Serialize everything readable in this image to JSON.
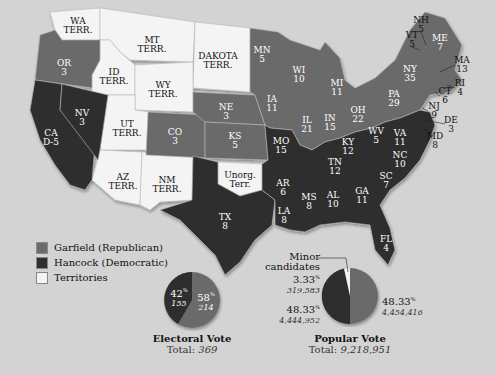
{
  "colors": {
    "garfield": "#6b6b6b",
    "hancock": "#2f2f2f",
    "territory": "#f4f4f4",
    "background": "#d3d3d3"
  },
  "legend": [
    {
      "label": "Garfield (Republican)",
      "color": "#6b6b6b"
    },
    {
      "label": "Hancock (Democratic)",
      "color": "#2f2f2f"
    },
    {
      "label": "Territories",
      "color": "#f4f4f4"
    }
  ],
  "states": [
    {
      "abbr": "WA",
      "sub": "TERR.",
      "x": 78,
      "y": 26,
      "party": "territory"
    },
    {
      "abbr": "MT",
      "sub": "TERR.",
      "x": 152,
      "y": 45,
      "party": "territory"
    },
    {
      "abbr": "DAKOTA",
      "sub": "TERR.",
      "x": 218,
      "y": 61,
      "party": "territory"
    },
    {
      "abbr": "OR",
      "sub": "3",
      "x": 64,
      "y": 68,
      "party": "garfield"
    },
    {
      "abbr": "ID",
      "sub": "TERR.",
      "x": 114,
      "y": 77,
      "party": "territory"
    },
    {
      "abbr": "WY",
      "sub": "TERR.",
      "x": 163,
      "y": 90,
      "party": "territory"
    },
    {
      "abbr": "NV",
      "sub": "3",
      "x": 82,
      "y": 118,
      "party": "hancock"
    },
    {
      "abbr": "UT",
      "sub": "TERR.",
      "x": 127,
      "y": 129,
      "party": "territory"
    },
    {
      "abbr": "CO",
      "sub": "3",
      "x": 175,
      "y": 137,
      "party": "garfield"
    },
    {
      "abbr": "CA",
      "sub": "D-5",
      "x": 51,
      "y": 138,
      "party": "hancock"
    },
    {
      "abbr": "NE",
      "sub": "3",
      "x": 226,
      "y": 112,
      "party": "garfield"
    },
    {
      "abbr": "KS",
      "sub": "5",
      "x": 235,
      "y": 141,
      "party": "garfield"
    },
    {
      "abbr": "AZ",
      "sub": "TERR.",
      "x": 123,
      "y": 182,
      "party": "territory"
    },
    {
      "abbr": "NM",
      "sub": "TERR.",
      "x": 167,
      "y": 185,
      "party": "territory"
    },
    {
      "abbr": "Unorg.",
      "sub": "Terr.",
      "x": 240,
      "y": 180,
      "party": "territory"
    },
    {
      "abbr": "TX",
      "sub": "8",
      "x": 225,
      "y": 222,
      "party": "hancock"
    },
    {
      "abbr": "MN",
      "sub": "5",
      "x": 262,
      "y": 55,
      "party": "garfield"
    },
    {
      "abbr": "WI",
      "sub": "10",
      "x": 299,
      "y": 75,
      "party": "garfield"
    },
    {
      "abbr": "MI",
      "sub": "11",
      "x": 337,
      "y": 88,
      "party": "garfield"
    },
    {
      "abbr": "IA",
      "sub": "11",
      "x": 272,
      "y": 104,
      "party": "garfield"
    },
    {
      "abbr": "IL",
      "sub": "21",
      "x": 307,
      "y": 125,
      "party": "garfield"
    },
    {
      "abbr": "IN",
      "sub": "15",
      "x": 330,
      "y": 123,
      "party": "garfield"
    },
    {
      "abbr": "OH",
      "sub": "22",
      "x": 358,
      "y": 115,
      "party": "garfield"
    },
    {
      "abbr": "PA",
      "sub": "29",
      "x": 394,
      "y": 99,
      "party": "garfield"
    },
    {
      "abbr": "NY",
      "sub": "35",
      "x": 410,
      "y": 74,
      "party": "garfield"
    },
    {
      "abbr": "ME",
      "sub": "7",
      "x": 440,
      "y": 43,
      "party": "garfield"
    },
    {
      "abbr": "NH",
      "sub": "5",
      "x": 421,
      "y": 25,
      "party": "garfield",
      "dark": true
    },
    {
      "abbr": "VT",
      "sub": "5",
      "x": 412,
      "y": 40,
      "party": "garfield",
      "dark": true
    },
    {
      "abbr": "MA",
      "sub": "13",
      "x": 462,
      "y": 65,
      "party": "garfield",
      "dark": true
    },
    {
      "abbr": "RI",
      "sub": "4",
      "x": 460,
      "y": 88,
      "party": "garfield",
      "dark": true
    },
    {
      "abbr": "CT",
      "sub": "6",
      "x": 445,
      "y": 96,
      "party": "garfield",
      "dark": true
    },
    {
      "abbr": "NJ",
      "sub": "9",
      "x": 434,
      "y": 111,
      "party": "hancock",
      "dark": true
    },
    {
      "abbr": "DE",
      "sub": "3",
      "x": 451,
      "y": 125,
      "party": "hancock",
      "dark": true
    },
    {
      "abbr": "MD",
      "sub": "8",
      "x": 435,
      "y": 141,
      "party": "hancock",
      "dark": true
    },
    {
      "abbr": "MO",
      "sub": "15",
      "x": 281,
      "y": 146,
      "party": "hancock"
    },
    {
      "abbr": "KY",
      "sub": "12",
      "x": 348,
      "y": 147,
      "party": "hancock"
    },
    {
      "abbr": "WV",
      "sub": "5",
      "x": 376,
      "y": 136,
      "party": "hancock"
    },
    {
      "abbr": "VA",
      "sub": "11",
      "x": 400,
      "y": 138,
      "party": "hancock"
    },
    {
      "abbr": "TN",
      "sub": "12",
      "x": 335,
      "y": 167,
      "party": "hancock"
    },
    {
      "abbr": "NC",
      "sub": "10",
      "x": 400,
      "y": 160,
      "party": "hancock"
    },
    {
      "abbr": "AR",
      "sub": "6",
      "x": 283,
      "y": 188,
      "party": "hancock"
    },
    {
      "abbr": "SC",
      "sub": "7",
      "x": 386,
      "y": 181,
      "party": "hancock"
    },
    {
      "abbr": "MS",
      "sub": "8",
      "x": 309,
      "y": 202,
      "party": "hancock"
    },
    {
      "abbr": "AL",
      "sub": "10",
      "x": 333,
      "y": 200,
      "party": "hancock"
    },
    {
      "abbr": "GA",
      "sub": "11",
      "x": 362,
      "y": 196,
      "party": "hancock"
    },
    {
      "abbr": "LA",
      "sub": "8",
      "x": 284,
      "y": 216,
      "party": "hancock"
    },
    {
      "abbr": "FL",
      "sub": "4",
      "x": 386,
      "y": 244,
      "party": "hancock"
    }
  ],
  "electoral_vote": {
    "title": "Electoral Vote",
    "total_label": "Total:",
    "total": "369",
    "hancock": {
      "pct": "42",
      "votes": "155"
    },
    "garfield": {
      "pct": "58",
      "votes": "214"
    }
  },
  "popular_vote": {
    "title": "Popular Vote",
    "total_label": "Total:",
    "total": "9,218,951",
    "minor": {
      "label1": "Minor",
      "label2": "candidates",
      "pct": "3.33",
      "votes": "319,583"
    },
    "hancock": {
      "pct": "48.33",
      "votes": "4,444,952"
    },
    "garfield": {
      "pct": "48.33",
      "votes": "4,454,416"
    }
  },
  "pct_sign": "%"
}
